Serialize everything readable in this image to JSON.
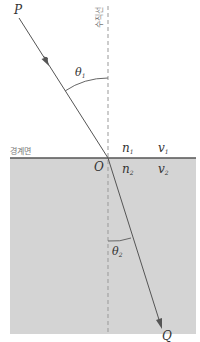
{
  "diagram": {
    "labels": {
      "point_p": "P",
      "point_q": "Q",
      "origin": "O",
      "normal_line": "수직선",
      "boundary": "경계면",
      "theta1": "θ",
      "theta1_sub": "1",
      "theta2": "θ",
      "theta2_sub": "2",
      "n1": "n",
      "n1_sub": "1",
      "n2": "n",
      "n2_sub": "2",
      "v1": "v",
      "v1_sub": "1",
      "v2": "v",
      "v2_sub": "2"
    },
    "colors": {
      "medium2_fill": "#d4d4d4",
      "boundary_line": "#555555",
      "ray": "#555555",
      "normal_dash": "#999999",
      "text": "#333333"
    }
  }
}
